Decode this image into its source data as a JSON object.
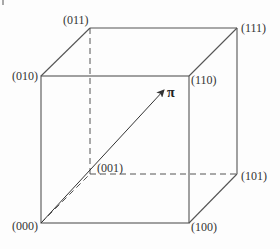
{
  "diagram": {
    "type": "unit-cube",
    "vertices": {
      "v000": "(000)",
      "v001": "(001)",
      "v010": "(010)",
      "v011": "(011)",
      "v100": "(100)",
      "v101": "(101)",
      "v110": "(110)",
      "v111": "(111)"
    },
    "vector_label": "π",
    "colors": {
      "edge": "#555555",
      "text": "#333333",
      "background": "#fdfdfd"
    }
  }
}
